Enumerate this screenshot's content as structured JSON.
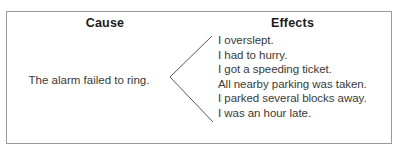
{
  "diagram": {
    "type": "cause-and-effect",
    "frame": {
      "border_color": "#9a9a9a",
      "background_color": "#ffffff"
    },
    "text_color": "#3a3a3a",
    "heading_color": "#1c1c1c",
    "connector": {
      "shape": "left-pointing-chevron",
      "color": "#575757"
    },
    "cause": {
      "heading": "Cause",
      "text": "The alarm failed to ring."
    },
    "effects": {
      "heading": "Effects",
      "items": [
        "I overslept.",
        "I had to hurry.",
        "I got a speeding ticket.",
        "All nearby parking was taken.",
        "I parked several blocks away.",
        "I was an hour late."
      ]
    }
  }
}
